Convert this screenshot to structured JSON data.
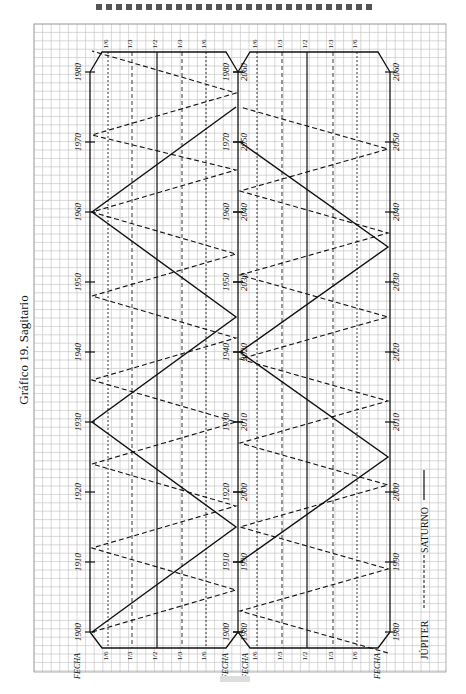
{
  "title": "Gráfico 19. Sagitario",
  "legend": {
    "jupiter": "JÚPITER",
    "saturno": "SATURNO"
  },
  "axis_label": "FECHA",
  "panels": [
    {
      "name": "upper",
      "years": [
        "1900",
        "1910",
        "1920",
        "1930",
        "1940",
        "1950",
        "1960",
        "1970",
        "1980"
      ]
    },
    {
      "name": "lower",
      "years": [
        "1980",
        "1990",
        "2000",
        "2010",
        "2020",
        "2030",
        "2040",
        "2050",
        "2060"
      ]
    }
  ],
  "fraction_labels": [
    "1/6",
    "1/3",
    "1/2",
    "1/3",
    "1/6"
  ],
  "chart_data": {
    "type": "line",
    "title": "Gráfico 19. Sagitario",
    "orientation": "rotated 90° (time axis vertical)",
    "xlabel": "FECHA",
    "x_ranges": [
      [
        1900,
        1980
      ],
      [
        1980,
        2060
      ]
    ],
    "x_ticks": [
      1900,
      1910,
      1920,
      1930,
      1940,
      1950,
      1960,
      1970,
      1980,
      1990,
      2000,
      2010,
      2020,
      2030,
      2040,
      2050,
      2060
    ],
    "y_levels": [
      "1/6",
      "1/3",
      "1/2",
      "1/3",
      "1/6"
    ],
    "series": [
      {
        "name": "SATURNO",
        "style": "solid",
        "peaks": [
          1900,
          1930,
          1960,
          1990,
          2020,
          2050
        ],
        "troughs": [
          1915,
          1945,
          1975,
          2005,
          2035
        ]
      },
      {
        "name": "JÚPITER",
        "style": "dashed",
        "peaks": [
          1900,
          1912,
          1924,
          1936,
          1948,
          1960,
          1971,
          1983,
          1995,
          2007,
          2019,
          2031,
          2043,
          2055
        ],
        "troughs": [
          1906,
          1918,
          1930,
          1942,
          1954,
          1966,
          1977,
          1989,
          2001,
          2013,
          2025,
          2037,
          2049
        ]
      }
    ],
    "grid": true
  }
}
